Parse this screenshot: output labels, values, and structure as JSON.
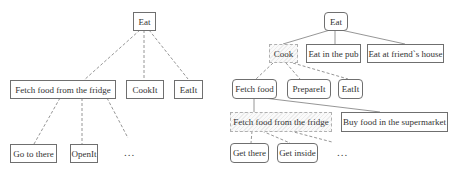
{
  "left_tree": {
    "root": "Eat",
    "level1": [
      "Fetch food from the fridge",
      "CookIt",
      "EatIt"
    ],
    "level2": [
      "Go to there",
      "OpenIt",
      "..."
    ]
  },
  "right_tree": {
    "root": "Eat",
    "level1": [
      "Cook",
      "Eat in the pub",
      "Eat at friend`s house"
    ],
    "level2": [
      "Fetch food",
      "PrepareIt",
      "EatIt"
    ],
    "level3": [
      "Fetch food from the fridge",
      "Buy food in the supermarket"
    ],
    "level4": [
      "Get there",
      "Get inside",
      "..."
    ]
  },
  "colors": {
    "border": "#6f6f6f",
    "edge": "#8a8a8a",
    "hatch": "#ececec"
  }
}
